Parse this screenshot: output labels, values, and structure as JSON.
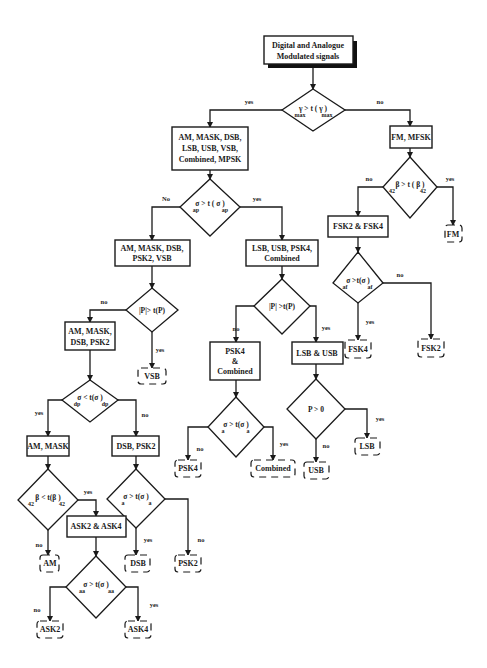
{
  "diagram": {
    "type": "decision-tree-flowchart",
    "root": {
      "id": "root",
      "lines": [
        "Digital and Analogue",
        "Modulated signals"
      ]
    },
    "decisions": {
      "d1": {
        "condition": "γmax > t(γmax)",
        "text": "γ  > t ( γ   )",
        "sub": [
          "max",
          "max"
        ]
      },
      "d2": {
        "condition": "σap > t(σap)",
        "text": "σ    >  t ( σ    )",
        "sub": [
          "ap",
          "ap"
        ]
      },
      "d3": {
        "condition": "β42 > t(β42)",
        "text": "β   >  t ( β   )",
        "sub": [
          "42",
          "42"
        ]
      },
      "d4": {
        "condition": "|P| > t(P)",
        "text": "|P|>  t(P)"
      },
      "d5": {
        "condition": "|P| > t(P)",
        "text": "|P|  >t(P)"
      },
      "d6": {
        "condition": "σaf > t(σaf)",
        "text": "σ   >t(σ   )",
        "sub": [
          "af",
          "af"
        ]
      },
      "d7": {
        "condition": "σdp < t(σdp)",
        "text": "σ   <  t(σ    )",
        "sub": [
          "dp",
          "dp"
        ]
      },
      "d8": {
        "condition": "σa > t(σa)",
        "text": "σ  >  t(σ  )",
        "sub": [
          "a",
          "a"
        ]
      },
      "d9": {
        "condition": "P > 0",
        "text": "P    >    0"
      },
      "d10": {
        "condition": "β42 < t(β42)",
        "text": "β   <  t(β   )",
        "sub": [
          "42",
          "42"
        ]
      },
      "d11": {
        "condition": "σa > t(σa)",
        "text": "σ   >  t(σ  )",
        "sub": [
          "a",
          "a"
        ]
      },
      "d12": {
        "condition": "σaa > t(σaa)",
        "text": "σ    >  t(σ    )",
        "sub": [
          "aa",
          "aa"
        ]
      }
    },
    "process_boxes": {
      "b1": {
        "lines": [
          "AM, MASK, DSB,",
          "LSB, USB,  VSB,",
          "Combined, MPSK"
        ]
      },
      "b2": {
        "lines": [
          "FM, MFSK"
        ]
      },
      "b3": {
        "lines": [
          "AM, MASK, DSB,",
          "PSK2, VSB"
        ]
      },
      "b4": {
        "lines": [
          "LSB, USB, PSK4,",
          "Combined"
        ]
      },
      "b5": {
        "lines": [
          "FSK2 & FSK4"
        ]
      },
      "b6": {
        "lines": [
          "AM, MASK,",
          "DSB, PSK2"
        ]
      },
      "b7": {
        "lines": [
          "PSK4",
          "&",
          "Combined"
        ]
      },
      "b8": {
        "lines": [
          "LSB & USB"
        ]
      },
      "b9": {
        "lines": [
          "AM, MASK"
        ]
      },
      "b10": {
        "lines": [
          "DSB, PSK2"
        ]
      },
      "b11": {
        "lines": [
          "ASK2 & ASK4"
        ]
      }
    },
    "terminals": {
      "t_fm": "FM",
      "t_vsb": "VSB",
      "t_fsk4": "FSK4",
      "t_fsk2": "FSK2",
      "t_psk4": "PSK4",
      "t_combined": "Combined",
      "t_usb": "USB",
      "t_lsb": "LSB",
      "t_am": "AM",
      "t_dsb": "DSB",
      "t_psk2": "PSK2",
      "t_ask2": "ASK2",
      "t_ask4": "ASK4"
    },
    "edge_labels": {
      "d1_yes": "yes",
      "d1_no": "no",
      "d2_no": "No",
      "d2_yes": "yes",
      "d3_no": "no",
      "d3_yes": "yes",
      "d4_no": "no",
      "d4_yes": "yes",
      "d5_no": "no",
      "d5_yes": "yes",
      "d6_yes": "yes",
      "d6_no": "no",
      "d7_yes": "yes",
      "d7_no": "no",
      "d8_no": "no",
      "d8_yes": "yes",
      "d9_yes": "yes",
      "d9_no": "no",
      "d10_yes": "yes",
      "d10_no": "no",
      "d11_yes": "yes",
      "d11_no": "no",
      "d12_no": "no",
      "d12_yes": "yes"
    },
    "colors": {
      "ink": "#1a1a1a",
      "background": "#ffffff"
    }
  }
}
